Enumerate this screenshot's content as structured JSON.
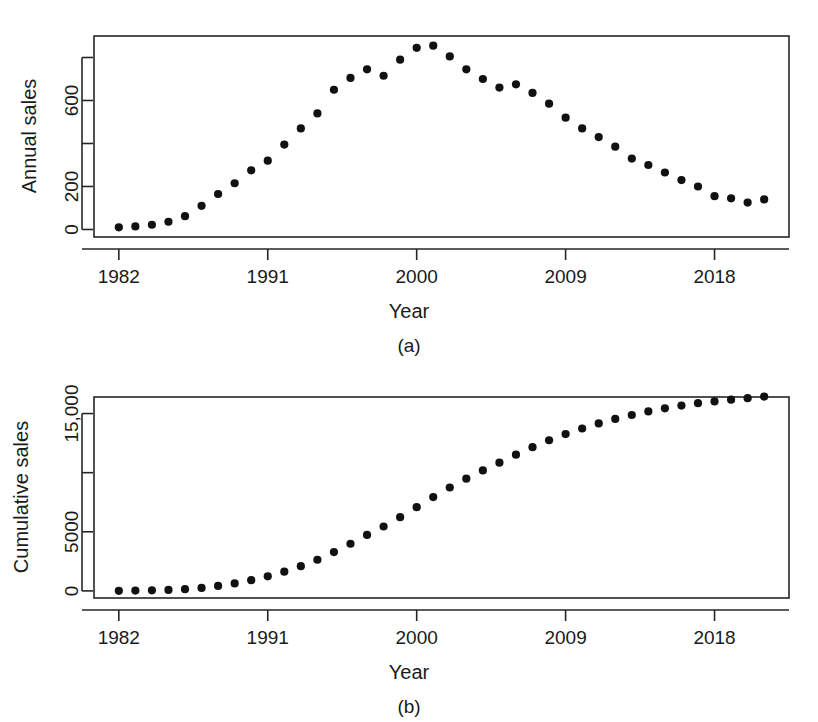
{
  "figure": {
    "background": "#ffffff",
    "marker_color": "#111111",
    "axis_color": "#262626"
  },
  "chart_data": [
    {
      "panel": "(a)",
      "type": "scatter",
      "title": "",
      "xlabel": "Year",
      "ylabel": "Annual sales",
      "xlim": [
        1980.5,
        2022.5
      ],
      "ylim": [
        -35,
        900
      ],
      "grid": false,
      "legend": null,
      "xticks": [
        1982,
        1991,
        2000,
        2009,
        2018
      ],
      "xtick_labels": [
        "1982",
        "1991",
        "2000",
        "2009",
        "2018"
      ],
      "yticks": [
        0,
        200,
        400,
        600,
        800
      ],
      "ytick_labels": [
        "0",
        "200",
        "",
        "600",
        ""
      ],
      "x": [
        1982,
        1983,
        1984,
        1985,
        1986,
        1987,
        1988,
        1989,
        1990,
        1991,
        1992,
        1993,
        1994,
        1995,
        1996,
        1997,
        1998,
        1999,
        2000,
        2001,
        2002,
        2003,
        2004,
        2005,
        2006,
        2007,
        2008,
        2009,
        2010,
        2011,
        2012,
        2013,
        2014,
        2015,
        2016,
        2017,
        2018,
        2019,
        2020,
        2021
      ],
      "values": [
        10,
        14,
        22,
        36,
        62,
        110,
        165,
        215,
        275,
        320,
        395,
        470,
        540,
        650,
        705,
        745,
        715,
        790,
        845,
        855,
        805,
        745,
        700,
        660,
        675,
        635,
        585,
        520,
        470,
        430,
        385,
        330,
        300,
        265,
        230,
        200,
        155,
        145,
        125,
        140
      ]
    },
    {
      "panel": "(b)",
      "type": "scatter",
      "title": "",
      "xlabel": "Year",
      "ylabel": "Cumulative sales",
      "xlim": [
        1980.5,
        2022.5
      ],
      "ylim": [
        -600,
        16400
      ],
      "grid": false,
      "legend": null,
      "xticks": [
        1982,
        1991,
        2000,
        2009,
        2018
      ],
      "xtick_labels": [
        "1982",
        "1991",
        "2000",
        "2009",
        "2018"
      ],
      "yticks": [
        0,
        5000,
        10000,
        15000
      ],
      "ytick_labels": [
        "0",
        "5000",
        "",
        "15,000"
      ],
      "x": [
        1982,
        1983,
        1984,
        1985,
        1986,
        1987,
        1988,
        1989,
        1990,
        1991,
        1992,
        1993,
        1994,
        1995,
        1996,
        1997,
        1998,
        1999,
        2000,
        2001,
        2002,
        2003,
        2004,
        2005,
        2006,
        2007,
        2008,
        2009,
        2010,
        2011,
        2012,
        2013,
        2014,
        2015,
        2016,
        2017,
        2018,
        2019,
        2020,
        2021
      ],
      "values": [
        10,
        24,
        46,
        82,
        144,
        254,
        419,
        634,
        909,
        1229,
        1624,
        2094,
        2634,
        3284,
        3989,
        4734,
        5449,
        6239,
        7084,
        7939,
        8744,
        9489,
        10189,
        10849,
        11524,
        12159,
        12744,
        13264,
        13734,
        14164,
        14549,
        14879,
        15179,
        15444,
        15674,
        15874,
        16029,
        16174,
        16299,
        16439
      ]
    }
  ],
  "labels": {
    "panel_a": "(a)",
    "panel_b": "(b)",
    "xlabel_a": "Year",
    "xlabel_b": "Year",
    "ylabel_a": "Annual sales",
    "ylabel_b": "Cumulative sales"
  }
}
